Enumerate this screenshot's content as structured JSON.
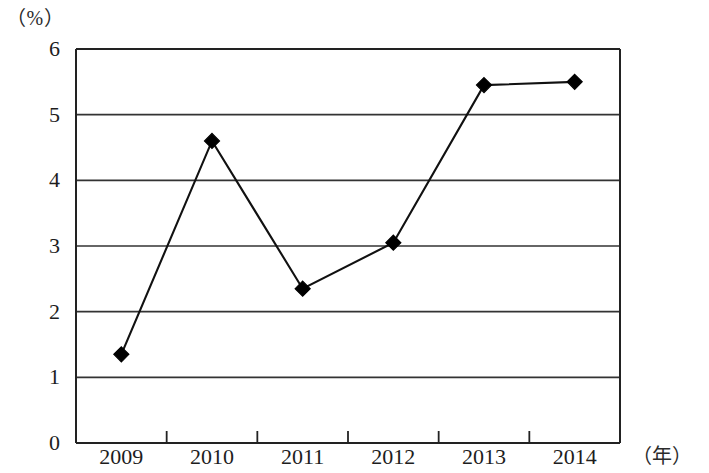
{
  "chart_data": {
    "type": "line",
    "title": "",
    "subtitle": "",
    "xlabel": "（年）",
    "ylabel": "（%）",
    "categories": [
      "2009",
      "2010",
      "2011",
      "2012",
      "2013",
      "2014"
    ],
    "x": [
      2009,
      2010,
      2011,
      2012,
      2013,
      2014
    ],
    "values": [
      1.35,
      4.6,
      2.35,
      3.05,
      5.45,
      5.5
    ],
    "series": [
      {
        "name": "",
        "values": [
          1.35,
          4.6,
          2.35,
          3.05,
          5.45,
          5.5
        ]
      }
    ],
    "ylim": [
      0,
      6
    ],
    "ytick_labels": [
      "0",
      "1",
      "2",
      "3",
      "4",
      "5",
      "6"
    ],
    "ytick_values": [
      0,
      1,
      2,
      3,
      4,
      5,
      6
    ],
    "xtick_labels": [
      "2009",
      "2010",
      "2011",
      "2012",
      "2013",
      "2014"
    ],
    "grid": "horizontal",
    "legend": "none",
    "marker": "diamond",
    "line_color": "#111111",
    "marker_color": "#000000",
    "grid_color": "#333333",
    "axis_color": "#222222",
    "background_color": "#ffffff",
    "annotations": []
  },
  "axes": {
    "y_unit_label": "（%）",
    "x_unit_label": "（年）"
  }
}
